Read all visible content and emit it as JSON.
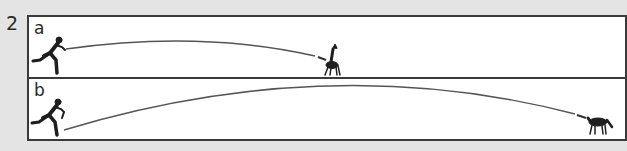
{
  "question_number": "2",
  "panels": [
    {
      "label": "a",
      "start": "running-man",
      "end": "deer",
      "arc": "short trajectory ending at deer"
    },
    {
      "label": "b",
      "start": "running-man",
      "end": "horse",
      "arc": "long trajectory ending at horse"
    }
  ],
  "colors": {
    "background": "#e4e4e4",
    "panel": "#ffffff",
    "ink": "#2a2a2a",
    "line": "#555555"
  }
}
